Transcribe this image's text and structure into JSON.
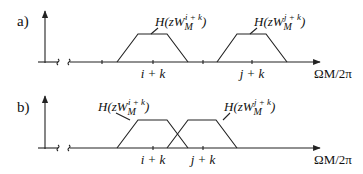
{
  "panels": [
    {
      "id": "a",
      "label": "a)",
      "filters": [
        {
          "label_base": "H(zW",
          "label_sub": "M",
          "label_sup": "i + k",
          "label_close": ")",
          "center_tick": "i + k"
        },
        {
          "label_base": "H(zW",
          "label_sub": "M",
          "label_sup": "j + k",
          "label_close": ")",
          "center_tick": "j + k"
        }
      ],
      "tick_labels": [
        "i + k",
        "j + k"
      ],
      "x_axis_label": "ΩM/2π",
      "overlap": false
    },
    {
      "id": "b",
      "label": "b)",
      "filters": [
        {
          "label_base": "H(zW",
          "label_sub": "M",
          "label_sup": "i + k",
          "label_close": ")",
          "center_tick": "i + k"
        },
        {
          "label_base": "H(zW",
          "label_sub": "M",
          "label_sup": "j + k",
          "label_close": ")",
          "center_tick": "j + k"
        }
      ],
      "tick_labels": [
        "i + k",
        "j + k"
      ],
      "x_axis_label": "ΩM/2π",
      "overlap": true
    }
  ],
  "colors": {
    "ink": "#222222",
    "background": "#ffffff"
  }
}
